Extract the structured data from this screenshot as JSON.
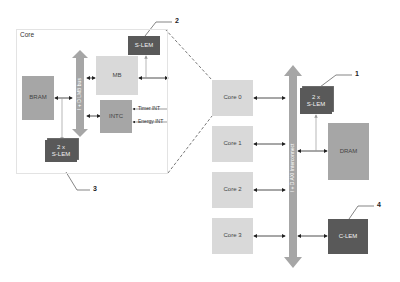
{
  "diagram": {
    "core_detail": {
      "title": "Core",
      "bus_label": "I + D LMB bus",
      "blocks": {
        "bram": "BRAM",
        "mb": "MB",
        "intc": "INTC",
        "slem_top": "S-LEM",
        "slem_bottom_count": "2 x",
        "slem_bottom": "S-LEM"
      },
      "interrupts": [
        "Timer INT",
        "Energy INT"
      ]
    },
    "system": {
      "cores": [
        "Core 0",
        "Core 1",
        "Core 2",
        "Core 3"
      ],
      "interconnect_label": "I + D AXI Interconnect",
      "slem_count": "2 x",
      "slem": "S-LEM",
      "dram": "DRAM",
      "clem": "C-LEM"
    },
    "callouts": [
      "1",
      "2",
      "3",
      "4"
    ],
    "colors": {
      "light_block": "#d9d9d9",
      "mid_block": "#a6a6a6",
      "dark_block": "#595959",
      "bus_arrow": "#a6a6a6"
    }
  }
}
